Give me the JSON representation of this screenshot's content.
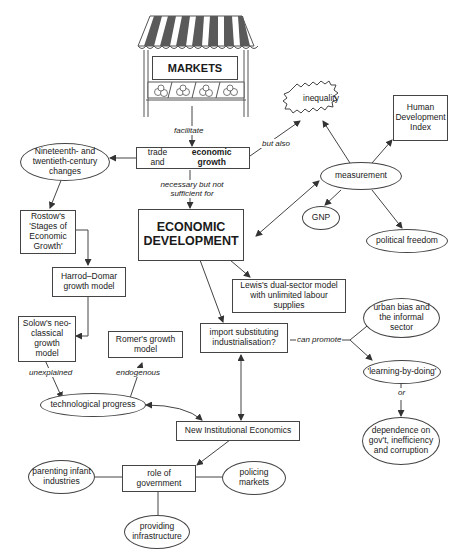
{
  "diagram": {
    "type": "concept-map",
    "market_stall": {
      "sign": "MARKETS"
    },
    "nodes": {
      "trade": {
        "text_pre": "trade and ",
        "text_bold": "economic growth"
      },
      "nineteenth": "Nineteenth- and twentieth-century changes",
      "rostow": "Rostow's 'Stages of Economic Growth'",
      "harrod": "Harrod–Domar growth model",
      "solow": "Solow's neo-classical growth model",
      "romer": "Romer's growth model",
      "tech": "technological progress",
      "econdev": "ECONOMIC DEVELOPMENT",
      "lewis": "Lewis's dual-sector model with unlimited labour supplies",
      "isi": "import substituting industrialisation?",
      "nie": "New Institutional Economics",
      "role": "role of government",
      "parenting": "parenting infant industries",
      "policing": "policing markets",
      "infrastructure": "providing infrastructure",
      "inequality": "inequality",
      "measurement": "measurement",
      "hdi": "Human Development Index",
      "gnp": "GNP",
      "freedom": "political freedom",
      "urban": "urban bias and the informal sector",
      "learning": "'learning-by-doing'",
      "dependence": "dependence on gov't, inefficiency and corruption"
    },
    "edge_labels": {
      "facilitate": "facilitate",
      "but_also": "but also",
      "necessary": "necessary but not sufficient for",
      "unexplained": "unexplained",
      "endogenous": "endogenous",
      "can_promote": "can promote",
      "or": "or"
    },
    "colors": {
      "line": "#444444",
      "stripe": "#555555"
    }
  }
}
